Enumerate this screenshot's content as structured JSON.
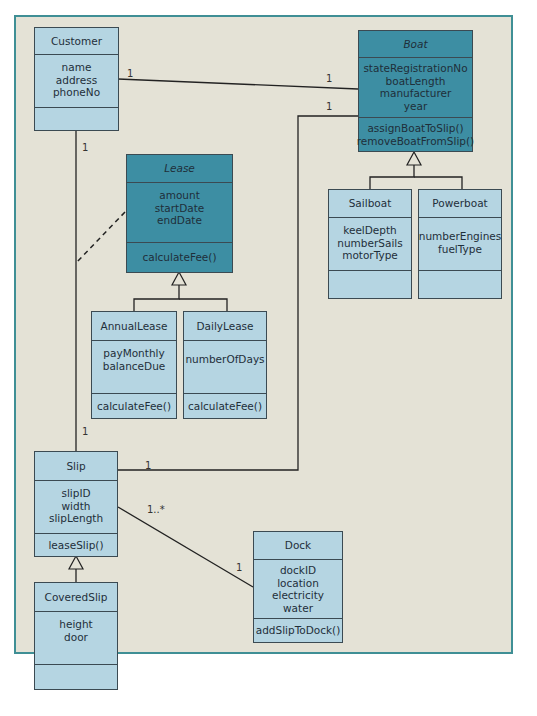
{
  "diagram": {
    "type": "UML class diagram",
    "classes": {
      "customer": {
        "name": "Customer",
        "attributes": [
          "name",
          "address",
          "phoneNo"
        ],
        "operations": []
      },
      "boat": {
        "name": "Boat",
        "abstract": true,
        "attributes": [
          "stateRegistrationNo",
          "boatLength",
          "manufacturer",
          "year"
        ],
        "operations": [
          "assignBoatToSlip()",
          "removeBoatFromSlip()"
        ]
      },
      "lease": {
        "name": "Lease",
        "abstract": true,
        "attributes": [
          "amount",
          "startDate",
          "endDate"
        ],
        "operations": [
          "calculateFee()"
        ]
      },
      "sailboat": {
        "name": "Sailboat",
        "attributes": [
          "keelDepth",
          "numberSails",
          "motorType"
        ],
        "operations": []
      },
      "powerboat": {
        "name": "Powerboat",
        "attributes": [
          "numberEngines",
          "fuelType"
        ],
        "operations": []
      },
      "annualLease": {
        "name": "AnnualLease",
        "attributes": [
          "payMonthly",
          "balanceDue"
        ],
        "operations": [
          "calculateFee()"
        ]
      },
      "dailyLease": {
        "name": "DailyLease",
        "attributes": [
          "numberOfDays"
        ],
        "operations": [
          "calculateFee()"
        ]
      },
      "slip": {
        "name": "Slip",
        "attributes": [
          "slipID",
          "width",
          "slipLength"
        ],
        "operations": [
          "leaseSlip()"
        ]
      },
      "dock": {
        "name": "Dock",
        "attributes": [
          "dockID",
          "location",
          "electricity",
          "water"
        ],
        "operations": [
          "addSlipToDock()"
        ]
      },
      "coveredSlip": {
        "name": "CoveredSlip",
        "attributes": [
          "height",
          "door"
        ],
        "operations": []
      }
    },
    "multiplicities": {
      "customer_boat_customer_end": "1",
      "customer_boat_boat_end": "1",
      "boat_slip_boat_end": "1",
      "customer_slip_customer_end": "1",
      "customer_slip_slip_end": "1",
      "slip_boat_slip_end": "1",
      "slip_dock_slip_end": "1..*",
      "slip_dock_dock_end": "1"
    },
    "colors": {
      "background": "#e4e2d6",
      "frame_border": "#3f8f95",
      "light_class": "#b5d5e2",
      "abstract_class": "#3d8ea3",
      "line": "#222222"
    }
  }
}
